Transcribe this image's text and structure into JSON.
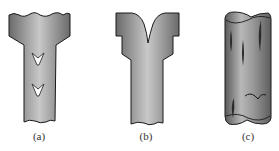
{
  "figure": {
    "panels": [
      {
        "id": "a",
        "label": "(a)",
        "description": "Bolt-like shank with wavy-fractured top and two chevron marks on stem"
      },
      {
        "id": "b",
        "label": "(b)",
        "description": "Shank with V-shaped split at top of head"
      },
      {
        "id": "c",
        "label": "(c)",
        "description": "Cylinder with longitudinal cracks and a transverse wavy crack"
      }
    ],
    "colors": {
      "fill_dark": "#6e6e6e",
      "fill_light": "#c9c9c9",
      "outline": "#1a1a1a",
      "background": "#ffffff"
    }
  }
}
